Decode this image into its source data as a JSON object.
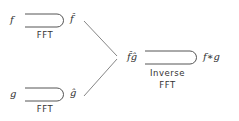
{
  "diagram": {
    "type": "flow",
    "nodes": [
      {
        "id": "f",
        "label": "f"
      },
      {
        "id": "f_hat",
        "label": "f̂"
      },
      {
        "id": "g",
        "label": "g"
      },
      {
        "id": "g_hat",
        "label": "ĝ"
      },
      {
        "id": "fg_hat",
        "label": "f̂ĝ"
      },
      {
        "id": "conv",
        "label": "f∗g"
      }
    ],
    "edges": [
      {
        "from": "f",
        "to": "f_hat",
        "label": "FFT"
      },
      {
        "from": "g",
        "to": "g_hat",
        "label": "FFT"
      },
      {
        "from": "f_hat",
        "to": "fg_hat",
        "label": ""
      },
      {
        "from": "g_hat",
        "to": "fg_hat",
        "label": ""
      },
      {
        "from": "fg_hat",
        "to": "conv",
        "label_line1": "Inverse",
        "label_line2": "FFT"
      }
    ]
  },
  "labels": {
    "f": "f",
    "f_hat": "f̂",
    "fft_top": "FFT",
    "g": "g",
    "g_hat": "ĝ",
    "fft_bottom": "FFT",
    "fg_hat": "f̂ĝ",
    "conv": "f∗g",
    "inverse_line1": "Inverse",
    "inverse_line2": "FFT"
  },
  "colors": {
    "stroke": "#444444",
    "text": "#333333"
  }
}
